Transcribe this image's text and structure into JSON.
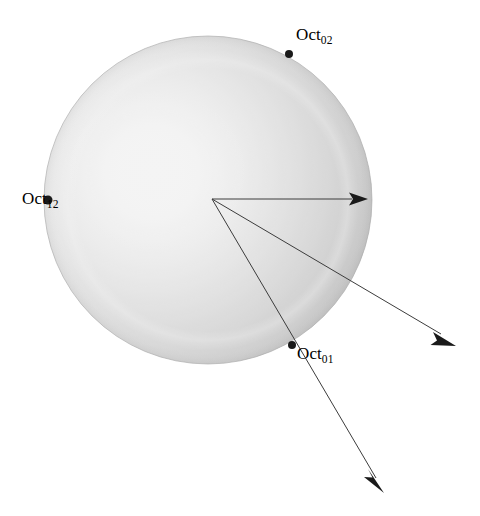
{
  "figure": {
    "type": "sphere-ray-diagram",
    "background_color": "#ffffff",
    "width": 480,
    "height": 516
  },
  "sphere": {
    "name": "shaded-sphere",
    "center": {
      "x": 208,
      "y": 200
    },
    "radius": 164,
    "highlight": {
      "x": 155,
      "y": 172
    },
    "colors": {
      "highlight": "#ffffff",
      "midtone": "#e2e2e2",
      "rim": "#b4b4b4",
      "rim_edge": "#a8a8a8",
      "inner_ring": "#d2d2d2"
    },
    "inner_ring_radius": 140
  },
  "points": [
    {
      "id": "oct02",
      "base": "Oct",
      "subscript": "02",
      "marker": {
        "x": 289,
        "y": 54
      },
      "marker_radius": 4,
      "marker_color": "#1a1a1a",
      "label_position": "above-right"
    },
    {
      "id": "oct12",
      "base": "Oct",
      "subscript": "12",
      "marker": {
        "x": 48,
        "y": 200
      },
      "marker_radius": 4,
      "marker_color": "#1a1a1a",
      "label_position": "left-overlap"
    },
    {
      "id": "oct01",
      "base": "Oct",
      "subscript": "01",
      "marker": {
        "x": 292,
        "y": 345
      },
      "marker_radius": 4,
      "marker_color": "#1a1a1a",
      "label_position": "below-right"
    }
  ],
  "rays": {
    "origin": {
      "x": 212,
      "y": 199
    },
    "color": "#3c3c3c",
    "stroke_width": 1,
    "items": [
      {
        "id": "ray-horizontal",
        "name": "ray-to-right-limb",
        "tip": {
          "x": 368,
          "y": 199
        }
      },
      {
        "id": "ray-middle",
        "name": "ray-lower-right",
        "tip": {
          "x": 456,
          "y": 346
        }
      },
      {
        "id": "ray-steep",
        "name": "ray-through-oct01",
        "tip": {
          "x": 384,
          "y": 493
        }
      }
    ],
    "arrowhead": {
      "length": 18,
      "half_width": 6.5,
      "color": "#1a1a1a"
    }
  }
}
